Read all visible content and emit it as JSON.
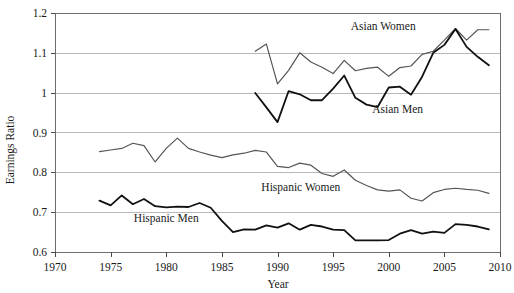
{
  "chart_data": {
    "type": "line",
    "title": "",
    "xlabel": "Year",
    "ylabel": "Earnings Ratio",
    "xlim": [
      1970,
      2010
    ],
    "ylim": [
      0.6,
      1.2
    ],
    "grid": true,
    "legend_position": "inline-labels",
    "xticks": [
      1970,
      1975,
      1980,
      1985,
      1990,
      1995,
      2000,
      2005,
      2010
    ],
    "yticks": [
      0.6,
      0.7,
      0.8,
      0.9,
      1.0,
      1.1,
      1.2
    ],
    "ytick_labels": [
      "0.6",
      "0.7",
      "0.8",
      "0.9",
      "1",
      "1.1",
      "1.2"
    ],
    "xtick_labels": [
      "1970",
      "1975",
      "1980",
      "1985",
      "1990",
      "1995",
      "2000",
      "2005",
      "2010"
    ],
    "series": [
      {
        "name": "Asian Women",
        "color": "#555555",
        "width": 1.2,
        "label_x": 1999.5,
        "label_y": 1.168,
        "x": [
          1988,
          1989,
          1990,
          1991,
          1992,
          1993,
          1994,
          1995,
          1996,
          1997,
          1998,
          1999,
          2000,
          2001,
          2002,
          2003,
          2004,
          2005,
          2006,
          2007,
          2008,
          2009
        ],
        "values": [
          1.104,
          1.122,
          1.022,
          1.056,
          1.1,
          1.077,
          1.064,
          1.048,
          1.081,
          1.055,
          1.061,
          1.064,
          1.041,
          1.063,
          1.067,
          1.096,
          1.104,
          1.132,
          1.161,
          1.132,
          1.158,
          1.158
        ]
      },
      {
        "name": "Asian Men",
        "color": "#111111",
        "width": 1.8,
        "label_x": 2000.8,
        "label_y": 0.958,
        "x": [
          1988,
          1989,
          1990,
          1991,
          1992,
          1993,
          1994,
          1995,
          1996,
          1997,
          1998,
          1999,
          2000,
          2001,
          2002,
          2003,
          2004,
          2005,
          2006,
          2007,
          2008,
          2009
        ],
        "values": [
          0.999,
          0.963,
          0.926,
          1.004,
          0.996,
          0.981,
          0.981,
          1.01,
          1.043,
          0.987,
          0.97,
          0.964,
          1.013,
          1.015,
          0.995,
          1.04,
          1.1,
          1.12,
          1.16,
          1.115,
          1.09,
          1.069
        ]
      },
      {
        "name": "Hispanic Women",
        "color": "#555555",
        "width": 1.2,
        "label_x": 1992.1,
        "label_y": 0.764,
        "x": [
          1974,
          1975,
          1976,
          1977,
          1978,
          1979,
          1980,
          1981,
          1982,
          1983,
          1984,
          1985,
          1986,
          1987,
          1988,
          1989,
          1990,
          1991,
          1992,
          1993,
          1994,
          1995,
          1996,
          1997,
          1998,
          1999,
          2000,
          2001,
          2002,
          2003,
          2004,
          2005,
          2006,
          2007,
          2008,
          2009
        ],
        "values": [
          0.852,
          0.856,
          0.86,
          0.873,
          0.867,
          0.826,
          0.86,
          0.886,
          0.86,
          0.851,
          0.843,
          0.837,
          0.844,
          0.848,
          0.855,
          0.851,
          0.815,
          0.812,
          0.823,
          0.818,
          0.797,
          0.79,
          0.806,
          0.78,
          0.767,
          0.756,
          0.753,
          0.756,
          0.735,
          0.728,
          0.749,
          0.757,
          0.76,
          0.757,
          0.755,
          0.747
        ]
      },
      {
        "name": "Hispanic Men",
        "color": "#111111",
        "width": 1.8,
        "label_x": 1980.0,
        "label_y": 0.686,
        "x": [
          1974,
          1975,
          1976,
          1977,
          1978,
          1979,
          1980,
          1981,
          1982,
          1983,
          1984,
          1985,
          1986,
          1987,
          1988,
          1989,
          1990,
          1991,
          1992,
          1993,
          1994,
          1995,
          1996,
          1997,
          1998,
          1999,
          2000,
          2001,
          2002,
          2003,
          2004,
          2005,
          2006,
          2007,
          2008,
          2009
        ],
        "values": [
          0.729,
          0.717,
          0.742,
          0.72,
          0.733,
          0.715,
          0.712,
          0.714,
          0.713,
          0.723,
          0.711,
          0.678,
          0.65,
          0.657,
          0.656,
          0.667,
          0.661,
          0.672,
          0.656,
          0.668,
          0.664,
          0.656,
          0.655,
          0.629,
          0.629,
          0.629,
          0.63,
          0.646,
          0.655,
          0.646,
          0.651,
          0.648,
          0.67,
          0.668,
          0.664,
          0.657
        ]
      }
    ]
  },
  "axes": {
    "y_axis_title": "Earnings Ratio",
    "x_axis_title": "Year"
  }
}
